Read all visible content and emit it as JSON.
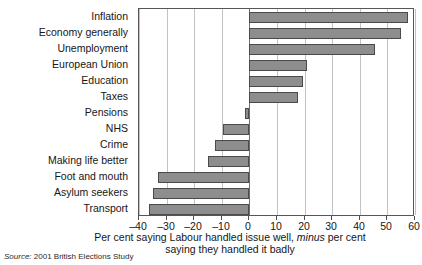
{
  "chart_data": {
    "type": "bar",
    "orientation": "horizontal",
    "title": "",
    "subtitle": "",
    "xlabel": "Per cent saying Labour handled issue well, minus per cent saying they handled it badly",
    "ylabel": "",
    "xlim": [
      -40,
      60
    ],
    "ylim": null,
    "grid": true,
    "legend": false,
    "legend_position": "none",
    "zero_reference_line": 0,
    "xticks": [
      -40,
      -30,
      -20,
      -10,
      0,
      10,
      20,
      30,
      40,
      50,
      60
    ],
    "xtick_labels": [
      "–40",
      "–30",
      "–20",
      "–10",
      "0",
      "10",
      "20",
      "30",
      "40",
      "50",
      "60"
    ],
    "categories": [
      "Inflation",
      "Economy generally",
      "Unemployment",
      "European Union",
      "Education",
      "Taxes",
      "Pensions",
      "NHS",
      "Crime",
      "Making life better",
      "Foot and mouth",
      "Asylum seekers",
      "Transport"
    ],
    "values": [
      57.5,
      55,
      45.5,
      21,
      19.5,
      17.5,
      -1.5,
      -9.5,
      -12.5,
      -15,
      -33,
      -35,
      -36.5
    ],
    "series": [
      {
        "name": "Net handling rating",
        "values": [
          57.5,
          55,
          45.5,
          21,
          19.5,
          17.5,
          -1.5,
          -9.5,
          -12.5,
          -15,
          -33,
          -35,
          -36.5
        ]
      }
    ],
    "bar_color": "#8d8d8d",
    "bar_border_color": "#4a4a4a",
    "grid_color": "#c2c2c6",
    "frame_color": "#55555a"
  },
  "axis_title": {
    "line1_before_italic": "Per cent saying Labour handled issue well, ",
    "line1_italic": "minus",
    "line1_after_italic": " per cent",
    "line2": "saying they handled it badly"
  },
  "source": {
    "label": "Source:",
    "text": " 2001 British Elections Study"
  }
}
